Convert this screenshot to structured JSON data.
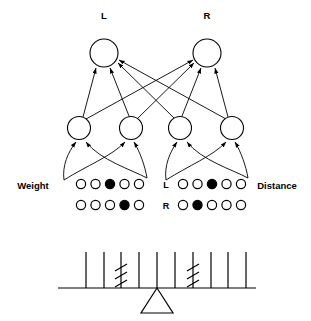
{
  "figure": {
    "ink_color": "#000000",
    "background_color": "#ffffff"
  },
  "output_layer": {
    "label_left": "L",
    "label_right": "R",
    "nodes": [
      {
        "id": "out-L",
        "label": "L",
        "cx": 104,
        "cy": 53,
        "r": 14
      },
      {
        "id": "out-R",
        "label": "R",
        "cx": 207,
        "cy": 53,
        "r": 14
      }
    ]
  },
  "hidden_layer": {
    "nodes": [
      {
        "id": "hid-1",
        "cx": 79,
        "cy": 128,
        "r": 11.5
      },
      {
        "id": "hid-2",
        "cx": 131,
        "cy": 128,
        "r": 11.5
      },
      {
        "id": "hid-3",
        "cx": 180,
        "cy": 128,
        "r": 11.5
      },
      {
        "id": "hid-4",
        "cx": 232,
        "cy": 128,
        "r": 11.5
      }
    ]
  },
  "input_groups": [
    {
      "id": "weight-group",
      "label": "Weight",
      "label_x": 33,
      "label_y": 189,
      "row_labels": [],
      "rows": [
        {
          "id": "weight-row-1",
          "y": 184,
          "units": [
            "open",
            "open",
            "filled",
            "open",
            "open"
          ],
          "active_index": 3
        },
        {
          "id": "weight-row-2",
          "y": 205,
          "units": [
            "open",
            "open",
            "open",
            "filled",
            "open"
          ],
          "active_index": 4
        }
      ],
      "unit_start_x": 81,
      "unit_spacing": 14.5,
      "unit_r": 4.6
    },
    {
      "id": "distance-group",
      "label": "Distance",
      "label_x": 277,
      "label_y": 189,
      "row_labels": [
        "L",
        "R"
      ],
      "rows": [
        {
          "id": "distance-row-L",
          "label": "L",
          "y": 184,
          "units": [
            "open",
            "open",
            "filled",
            "open",
            "open"
          ],
          "active_index": 3
        },
        {
          "id": "distance-row-R",
          "label": "R",
          "y": 205,
          "units": [
            "open",
            "filled",
            "open",
            "open",
            "open"
          ],
          "active_index": 2
        }
      ],
      "unit_start_x": 183,
      "unit_spacing": 14.5,
      "unit_r": 4.6,
      "row_label_x": 166
    }
  ],
  "balance": {
    "beam": {
      "x1": 58,
      "x2": 256,
      "y": 288
    },
    "fulcrum": {
      "apex_x": 157,
      "apex_y": 288,
      "base_left_x": 141,
      "base_right_x": 173,
      "base_y": 313
    },
    "peg_height": 36,
    "left_arm": {
      "side": "L",
      "pegs_x": [
        86,
        104,
        121,
        139,
        157
      ],
      "weight_peg_index": 3,
      "weight_hatch_count": 3
    },
    "right_arm": {
      "side": "R",
      "pegs_x": [
        175,
        193,
        211,
        228,
        246
      ],
      "weight_peg_index": 2,
      "weight_hatch_count": 3
    }
  }
}
